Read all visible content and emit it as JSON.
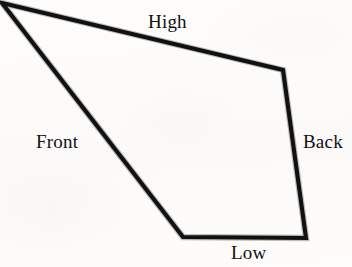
{
  "figure": {
    "kind": "line-drawing",
    "width": 352,
    "height": 267,
    "background_color": "#fdfcfb",
    "stroke_color": "#111111",
    "stroke_width": 4
  },
  "shape": {
    "name": "quadrilateral",
    "closed": true,
    "fill": "none",
    "vertices": [
      {
        "name": "top-left",
        "x": 2,
        "y": 3
      },
      {
        "name": "top-right",
        "x": 283,
        "y": 70
      },
      {
        "name": "bottom-right",
        "x": 306,
        "y": 238
      },
      {
        "name": "bottom-left",
        "x": 183,
        "y": 237
      }
    ],
    "path": "M 2 3 L 283 70 L 306 238 L 183 237 Z"
  },
  "labels": {
    "high": {
      "text": "High",
      "edge": "top",
      "x": 148,
      "y": 12
    },
    "front": {
      "text": "Front",
      "edge": "left",
      "x": 36,
      "y": 132
    },
    "back": {
      "text": "Back",
      "edge": "right",
      "x": 303,
      "y": 132
    },
    "low": {
      "text": "Low",
      "edge": "bottom",
      "x": 231,
      "y": 243
    }
  },
  "edges": [
    {
      "id": "high",
      "label": "High",
      "from": "top-left",
      "to": "top-right"
    },
    {
      "id": "back",
      "label": "Back",
      "from": "top-right",
      "to": "bottom-right"
    },
    {
      "id": "low",
      "label": "Low",
      "from": "bottom-right",
      "to": "bottom-left"
    },
    {
      "id": "front",
      "label": "Front",
      "from": "bottom-left",
      "to": "top-left"
    }
  ]
}
